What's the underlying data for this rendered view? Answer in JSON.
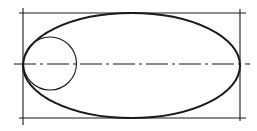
{
  "diagram": {
    "elements": [
      {
        "id": "bounding-rectangle",
        "kind": "rectangle",
        "description": "Construction rectangle with extended corner lines"
      },
      {
        "id": "ellipse",
        "kind": "ellipse",
        "description": "Ellipse inscribed in the rectangle"
      },
      {
        "id": "circle",
        "kind": "circle",
        "description": "Circle tangent to the left end of the ellipse"
      },
      {
        "id": "center-line",
        "kind": "line",
        "style": "dash-dot",
        "description": "Horizontal major axis center line"
      }
    ],
    "colors": {
      "stroke": "#1a1a1a",
      "background": "#ffffff"
    }
  }
}
